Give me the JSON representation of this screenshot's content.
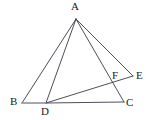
{
  "figure": {
    "kind": "geometry-diagram",
    "width": 159,
    "height": 120,
    "background_color": "#ffffff",
    "stroke_color": "#3a3a46",
    "baseline_color": "#8a8a92",
    "stroke_width": 0.9
  },
  "points": [
    {
      "id": "A",
      "label": "A",
      "x": 76,
      "y": 19,
      "label_x": 71,
      "label_y": 1
    },
    {
      "id": "B",
      "label": "B",
      "x": 22,
      "y": 103,
      "label_x": 10,
      "label_y": 96
    },
    {
      "id": "C",
      "label": "C",
      "x": 124,
      "y": 102,
      "label_x": 126,
      "label_y": 97
    },
    {
      "id": "D",
      "label": "D",
      "x": 46,
      "y": 103,
      "label_x": 41,
      "label_y": 106
    },
    {
      "id": "E",
      "label": "E",
      "x": 133,
      "y": 76,
      "label_x": 136,
      "label_y": 70
    },
    {
      "id": "F",
      "label": "F",
      "x": 118,
      "y": 80,
      "label_x": 112,
      "label_y": 70
    }
  ],
  "segments": [
    {
      "id": "AB",
      "from": "A",
      "to": "B",
      "style": "solid"
    },
    {
      "id": "AD",
      "from": "A",
      "to": "D",
      "style": "solid"
    },
    {
      "id": "AC",
      "from": "A",
      "to": "C",
      "style": "solid"
    },
    {
      "id": "AE",
      "from": "A",
      "to": "E",
      "style": "solid"
    },
    {
      "id": "DE",
      "from": "D",
      "to": "E",
      "style": "solid"
    },
    {
      "id": "DC",
      "from": "D",
      "to": "C",
      "style": "solid"
    },
    {
      "id": "BD",
      "from": "B",
      "to": "D",
      "style": "baseline"
    }
  ]
}
